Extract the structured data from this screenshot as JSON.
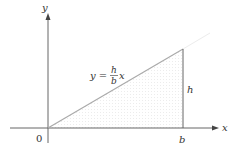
{
  "figure": {
    "axes": {
      "x_label": "x",
      "y_label": "y",
      "origin_label": "0"
    },
    "line": {
      "equation_lhs": "y =",
      "fraction_numerator": "h",
      "fraction_denominator": "b",
      "equation_var": "x"
    },
    "triangle": {
      "base_label": "b",
      "height_label": "h"
    },
    "colors": {
      "axis": "#555555",
      "line": "#aaaaaa",
      "fill": "#f4f4f4"
    }
  }
}
